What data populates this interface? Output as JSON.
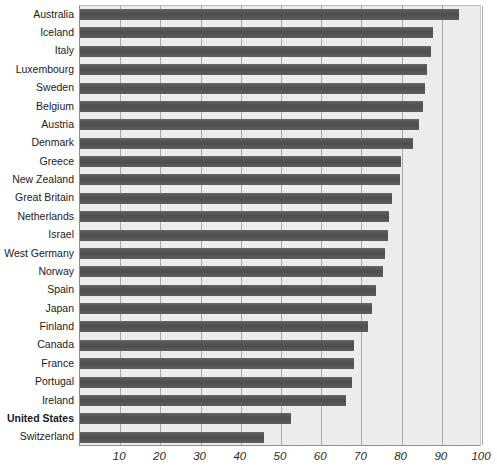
{
  "chart_data": {
    "type": "bar",
    "orientation": "horizontal",
    "title": "",
    "subtitle": "",
    "xlabel": "",
    "ylabel": "",
    "xlim": [
      0,
      100
    ],
    "grid": true,
    "legend": null,
    "highlight_category": "United States",
    "xticks": [
      10,
      20,
      30,
      40,
      50,
      60,
      70,
      80,
      90,
      100
    ],
    "xtick_labels": [
      "10",
      "20",
      "30",
      "40",
      "50",
      "60",
      "70",
      "80",
      "90",
      "100"
    ],
    "categories": [
      "Australia",
      "Iceland",
      "Italy",
      "Luxembourg",
      "Sweden",
      "Belgium",
      "Austria",
      "Denmark",
      "Greece",
      "New Zealand",
      "Great Britain",
      "Netherlands",
      "Israel",
      "West Germany",
      "Norway",
      "Spain",
      "Japan",
      "Finland",
      "Canada",
      "France",
      "Portugal",
      "Ireland",
      "United States",
      "Switzerland"
    ],
    "values": [
      94.5,
      88.0,
      87.5,
      86.5,
      86.0,
      85.5,
      84.5,
      83.0,
      80.0,
      79.8,
      77.8,
      77.0,
      76.8,
      76.0,
      75.5,
      74.0,
      72.8,
      72.0,
      68.5,
      68.5,
      68.0,
      66.5,
      52.8,
      46.0
    ]
  },
  "style": {
    "bar_color": "#565656",
    "plot_background": "#eeecea",
    "gridline_color": "#a9a9a9",
    "axis_color": "#8d8d8d",
    "label_color": "#1a1a1a",
    "page_background": "#ffffff"
  }
}
